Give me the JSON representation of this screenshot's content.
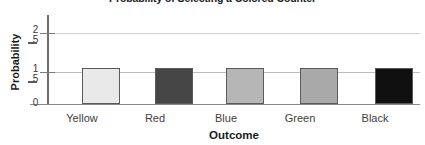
{
  "chart_data": {
    "type": "bar",
    "title": "Probability of Selecting a Colored Counter",
    "xlabel": "Outcome",
    "ylabel": "Probability",
    "categories": [
      "Yellow",
      "Red",
      "Blue",
      "Green",
      "Black"
    ],
    "values": [
      0.2,
      0.2,
      0.2,
      0.2,
      0.2
    ],
    "value_labels": [
      "1/5",
      "1/5",
      "1/5",
      "1/5",
      "1/5"
    ],
    "ylim": [
      0,
      0.5
    ],
    "grid": true,
    "legend": false,
    "y_ticks": [
      {
        "value": 0.4,
        "numerator": "2",
        "denominator": "5"
      },
      {
        "value": 0.2,
        "numerator": "1",
        "denominator": "5"
      },
      {
        "value": 0,
        "label": "0"
      }
    ],
    "bar_colors": [
      "#e9e9e9",
      "#464646",
      "#b6b6b6",
      "#a9a9a9",
      "#101010"
    ],
    "bar_border_color": "#5a5a5a",
    "gridline_color": "#cfcfcf",
    "axis_color": "#6d6d6d",
    "background": "#ffffff"
  },
  "axes": {
    "y_zero_label": "0"
  }
}
